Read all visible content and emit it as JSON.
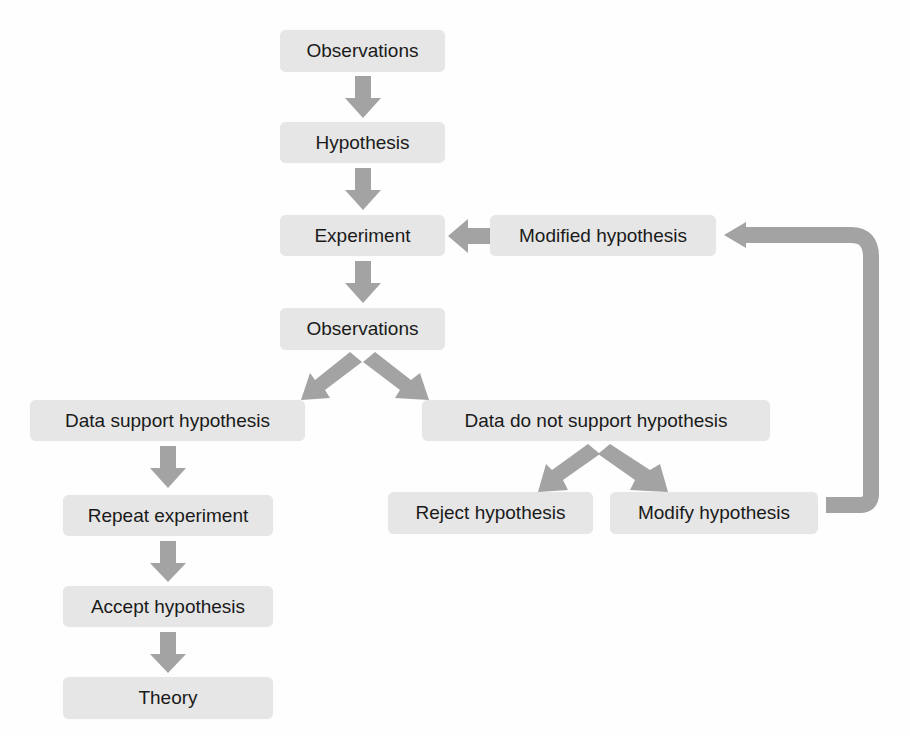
{
  "diagram": {
    "type": "flowchart",
    "colors": {
      "node_fill": "#e6e6e6",
      "arrow": "#a3a3a3",
      "text": "#1a1a1a"
    },
    "nodes": {
      "observations_1": "Observations",
      "hypothesis": "Hypothesis",
      "experiment": "Experiment",
      "modified_hypothesis": "Modified hypothesis",
      "observations_2": "Observations",
      "data_support": "Data support hypothesis",
      "data_not_support": "Data do not support hypothesis",
      "reject": "Reject hypothesis",
      "modify": "Modify hypothesis",
      "repeat": "Repeat experiment",
      "accept": "Accept hypothesis",
      "theory": "Theory"
    },
    "edges": [
      [
        "Observations",
        "Hypothesis"
      ],
      [
        "Hypothesis",
        "Experiment"
      ],
      [
        "Experiment",
        "Observations"
      ],
      [
        "Observations",
        "Data support hypothesis"
      ],
      [
        "Observations",
        "Data do not support hypothesis"
      ],
      [
        "Data support hypothesis",
        "Repeat experiment"
      ],
      [
        "Repeat experiment",
        "Accept hypothesis"
      ],
      [
        "Accept hypothesis",
        "Theory"
      ],
      [
        "Data do not support hypothesis",
        "Reject hypothesis"
      ],
      [
        "Data do not support hypothesis",
        "Modify hypothesis"
      ],
      [
        "Modify hypothesis",
        "Modified hypothesis"
      ],
      [
        "Modified hypothesis",
        "Experiment"
      ]
    ]
  }
}
